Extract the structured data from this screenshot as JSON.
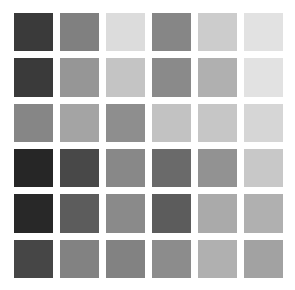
{
  "page": {
    "background_color": "#ffffff"
  },
  "grid": {
    "rows": 6,
    "columns": 6,
    "total_swatches": 36,
    "gap_px": 7,
    "swatch_size_px": 38
  },
  "chart_data": {
    "type": "heatmap",
    "subtitle": "",
    "xlabel": "",
    "ylabel": "",
    "grid": false,
    "legend_position": "none",
    "colorscale": "grayscale",
    "value_units": "8-bit luminance",
    "vmin": 0,
    "vmax": 255,
    "x": [
      "1",
      "2",
      "3",
      "4",
      "5",
      "6"
    ],
    "y": [
      "1",
      "2",
      "3",
      "4",
      "5",
      "6"
    ],
    "values": [
      [
        58,
        128,
        220,
        134,
        204,
        226
      ],
      [
        58,
        150,
        196,
        138,
        176,
        226
      ],
      [
        134,
        164,
        142,
        194,
        198,
        214
      ],
      [
        38,
        72,
        136,
        106,
        146,
        200
      ],
      [
        40,
        92,
        138,
        92,
        170,
        176
      ],
      [
        70,
        130,
        130,
        140,
        176,
        162
      ]
    ],
    "colors": [
      [
        "#3a3a3a",
        "#808080",
        "#dcdcdc",
        "#868686",
        "#cccccc",
        "#e2e2e2"
      ],
      [
        "#3a3a3a",
        "#969696",
        "#c4c4c4",
        "#8a8a8a",
        "#b0b0b0",
        "#e2e2e2"
      ],
      [
        "#868686",
        "#a4a4a4",
        "#8e8e8e",
        "#c2c2c2",
        "#c6c6c6",
        "#d6d6d6"
      ],
      [
        "#262626",
        "#484848",
        "#888888",
        "#6a6a6a",
        "#929292",
        "#c8c8c8"
      ],
      [
        "#282828",
        "#5c5c5c",
        "#8a8a8a",
        "#5c5c5c",
        "#aaaaaa",
        "#b0b0b0"
      ],
      [
        "#464646",
        "#828282",
        "#828282",
        "#8c8c8c",
        "#b0b0b0",
        "#a2a2a2"
      ]
    ]
  }
}
